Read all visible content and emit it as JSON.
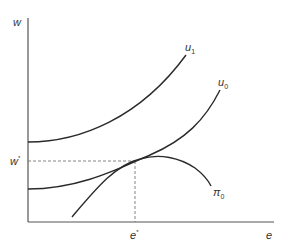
{
  "diagram": {
    "type": "economics-indifference-curves",
    "axes": {
      "y_label": "w",
      "x_label": "e"
    },
    "curves": [
      {
        "id": "u1",
        "label": "u",
        "subscript": "1",
        "description": "higher indifference curve"
      },
      {
        "id": "u0",
        "label": "u",
        "subscript": "0",
        "description": "indifference curve tangent to profit curve"
      },
      {
        "id": "pi0",
        "label": "π",
        "subscript": "0",
        "description": "iso-profit / output curve, concave"
      }
    ],
    "equilibrium": {
      "w_label": "w",
      "w_superscript": "*",
      "e_label": "e",
      "e_superscript": "*"
    }
  },
  "colors": {
    "axis": "#555555",
    "curve": "#2a2a2a",
    "dashed": "#666666",
    "text": "#333333"
  }
}
